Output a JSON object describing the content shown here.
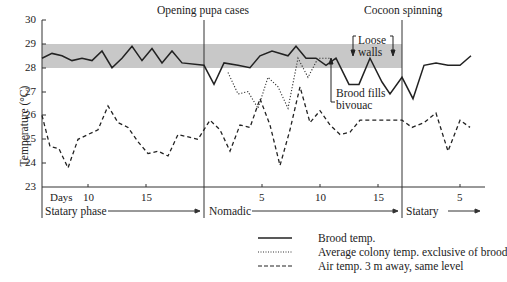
{
  "chart_data": {
    "type": "line",
    "title": "",
    "ylabel": "Temperature (°C)",
    "xlabel": "Days",
    "ylim": [
      23,
      30
    ],
    "yticks": [
      "30",
      "29",
      "28",
      "27",
      "26",
      "25",
      "24",
      "23"
    ],
    "shaded_band": {
      "from": 28,
      "to": 29,
      "color": "#c8c8c8"
    },
    "grid": false,
    "phases": [
      {
        "name": "Statary phase",
        "x_ticks": [
          "10",
          "15"
        ],
        "label_days": "Days"
      },
      {
        "name": "Nomadic",
        "x_ticks": [
          "5",
          "10",
          "15"
        ]
      },
      {
        "name": "Statary",
        "x_ticks": [
          "5"
        ]
      }
    ],
    "annotations": [
      {
        "text": "Opening pupa cases",
        "type": "vertical-line",
        "at": "start of Nomadic"
      },
      {
        "text": "Cocoon spinning",
        "type": "vertical-line",
        "at": "start of second Statary"
      },
      {
        "text": "Loose walls",
        "type": "bracket",
        "at": "Nomadic days 13-16"
      },
      {
        "text": "Brood fills bivouac",
        "type": "arrow",
        "at": "Nomadic day 11"
      }
    ],
    "x_px": [
      42,
      52,
      62,
      72,
      82,
      92,
      102,
      112,
      122,
      132,
      142,
      152,
      162,
      172,
      182,
      192,
      204,
      214,
      224,
      234,
      244,
      254,
      264,
      274,
      284,
      294,
      304,
      314,
      324,
      334,
      344,
      354,
      364,
      374,
      384,
      394,
      404,
      414,
      424,
      434,
      444,
      454,
      464,
      474
    ],
    "series": [
      {
        "name": "Brood temp.",
        "style": "solid",
        "values": [
          28.4,
          28.6,
          28.5,
          28.3,
          28.4,
          28.3,
          28.7,
          28.0,
          28.4,
          28.9,
          28.3,
          28.8,
          28.2,
          28.7,
          28.2,
          28.0,
          27.3,
          28.2,
          28.1,
          28.0,
          28.5,
          28.7,
          28.6,
          28.5,
          28.9,
          28.4,
          28.4,
          28.1,
          28.4,
          27.3,
          27.3,
          28.4,
          27.6,
          26.7,
          28.1,
          28.2,
          28.1,
          28.1,
          28.5
        ]
      },
      {
        "name": "Average colony temp. exclusive of brood",
        "style": "dotted",
        "values": [
          null,
          null,
          null,
          null,
          null,
          null,
          null,
          null,
          null,
          null,
          null,
          null,
          null,
          null,
          null,
          null,
          null,
          27.8,
          26.9,
          27.0,
          26.3,
          27.6,
          27.2,
          26.2,
          28.4,
          27.6,
          28.4
        ]
      },
      {
        "name": "Air temp. 3 m away, same level",
        "style": "dashed",
        "values": [
          26.0,
          24.7,
          24.6,
          23.8,
          25.0,
          25.2,
          25.4,
          26.4,
          25.7,
          25.5,
          24.9,
          24.4,
          24.5,
          24.3,
          25.2,
          25.8,
          25.4,
          24.5,
          25.5,
          25.4,
          26.7,
          25.6,
          23.9,
          25.4,
          27.2,
          25.7,
          26.2,
          25.6,
          25.2,
          25.3,
          25.8,
          25.8,
          25.5,
          25.7,
          26.1,
          24.5,
          25.8,
          25.5
        ]
      }
    ]
  },
  "labels": {
    "opening": "Opening pupa cases",
    "cocoon": "Cocoon spinning",
    "loose": "Loose",
    "walls": "walls",
    "brood_fills": "Brood fills",
    "bivouac": "bivouac",
    "ylabel": "Temperature (°C)",
    "days": "Days",
    "statary_phase": "Statary phase",
    "nomadic": "Nomadic",
    "statary": "Statary",
    "t10a": "10",
    "t15a": "15",
    "t5b": "5",
    "t10b": "10",
    "t15b": "15",
    "t5c": "5",
    "y30": "30",
    "y29": "29",
    "y28": "28",
    "y27": "27",
    "y26": "26",
    "y25": "25",
    "y24": "24",
    "y23": "23"
  },
  "legend": [
    {
      "label": "Brood temp.",
      "style": "solid"
    },
    {
      "label": "Average colony temp. exclusive of brood",
      "style": "dotted"
    },
    {
      "label": "Air temp. 3 m away, same level",
      "style": "dashed"
    }
  ]
}
